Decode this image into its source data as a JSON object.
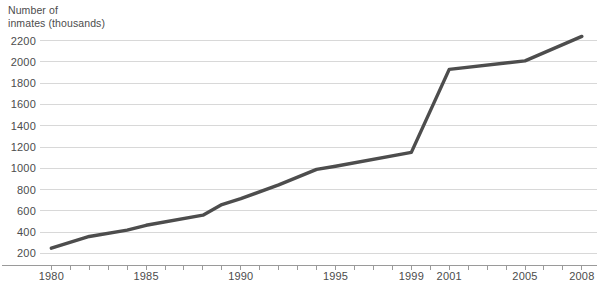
{
  "chart_data": {
    "type": "line",
    "title": "",
    "ylabel": "Number of\ninmates (thousands)",
    "xlabel": "",
    "ylim": [
      120,
      2300
    ],
    "xlim": [
      1979.4,
      2008.8
    ],
    "yticks": [
      200,
      400,
      600,
      800,
      1000,
      1200,
      1400,
      1600,
      1800,
      2000,
      2200
    ],
    "ytick_labels": [
      "200",
      "400",
      "600",
      "800",
      "1000",
      "1200",
      "1400",
      "1600",
      "1800",
      "2000",
      "2200"
    ],
    "xticks": [
      1980,
      1985,
      1990,
      1995,
      1999,
      2001,
      2005,
      2008
    ],
    "xtick_labels": [
      "1980",
      "1985",
      "1990",
      "1995",
      "1999",
      "2001",
      "2005",
      "2008"
    ],
    "minor_xticks_every": 1,
    "grid": "horizontal",
    "legend": "none",
    "line_color": "#4d4d4d",
    "grid_color": "#d8d8d8",
    "axis_color": "#9a9a9a",
    "background": "#ffffff",
    "x": [
      1980,
      1982,
      1984,
      1985,
      1988,
      1989,
      1990,
      1992,
      1994,
      1995,
      1999,
      2001,
      2005,
      2008
    ],
    "values": [
      250,
      360,
      420,
      465,
      560,
      660,
      715,
      845,
      990,
      1020,
      1150,
      1930,
      2010,
      2240
    ],
    "series": [
      {
        "name": "Number of inmates (thousands)",
        "values": [
          250,
          360,
          420,
          465,
          560,
          660,
          715,
          845,
          990,
          1020,
          1150,
          1930,
          2010,
          2240
        ]
      }
    ]
  }
}
